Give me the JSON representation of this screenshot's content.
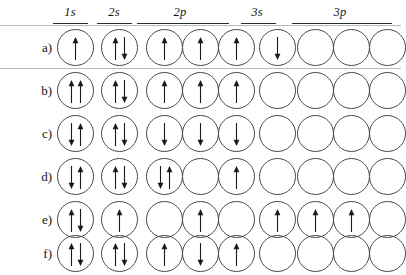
{
  "figure": {
    "kind": "orbital-diagram",
    "columns": [
      {
        "id": "1s",
        "label": "1s",
        "boxes": 1
      },
      {
        "id": "2s",
        "label": "2s",
        "boxes": 1
      },
      {
        "id": "2p",
        "label": "2p",
        "boxes": 3
      },
      {
        "id": "3s",
        "label": "3s",
        "boxes": 1
      },
      {
        "id": "3p",
        "label": "3p",
        "boxes": 3
      }
    ],
    "rows": [
      {
        "label": "a)",
        "orbitals": [
          [
            "up"
          ],
          [
            "up",
            "down"
          ],
          [
            "up"
          ],
          [
            "up"
          ],
          [
            "up"
          ],
          [
            "down"
          ],
          [],
          [],
          []
        ]
      },
      {
        "label": "b)",
        "orbitals": [
          [
            "up",
            "up"
          ],
          [
            "up",
            "down"
          ],
          [
            "up"
          ],
          [
            "up"
          ],
          [
            "up"
          ],
          [],
          [],
          [],
          []
        ]
      },
      {
        "label": "c)",
        "orbitals": [
          [
            "down",
            "up"
          ],
          [
            "up",
            "down"
          ],
          [
            "down"
          ],
          [
            "down"
          ],
          [
            "down"
          ],
          [],
          [],
          [],
          []
        ]
      },
      {
        "label": "d)",
        "orbitals": [
          [
            "down",
            "up"
          ],
          [
            "up",
            "down"
          ],
          [
            "down",
            "up"
          ],
          [],
          [
            "up"
          ],
          [],
          [],
          [],
          []
        ]
      },
      {
        "label": "e)",
        "orbitals": [
          [
            "up",
            "down"
          ],
          [
            "up"
          ],
          [],
          [
            "up"
          ],
          [],
          [
            "up"
          ],
          [
            "up"
          ],
          [
            "up"
          ],
          []
        ]
      },
      {
        "label": "f)",
        "orbitals": [
          [
            "up",
            "down"
          ],
          [
            "up",
            "down"
          ],
          [
            "up"
          ],
          [
            "down"
          ],
          [
            "up"
          ],
          [],
          [],
          [],
          []
        ]
      }
    ]
  },
  "style": {
    "circle_stroke": "#4a4a4a",
    "arrow_color": "#1a1a1a",
    "rule_color": "#2b2b2b",
    "separator_color": "#b9b9b9"
  }
}
